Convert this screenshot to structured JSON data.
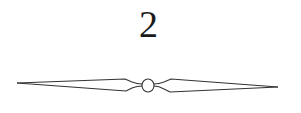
{
  "page": {
    "chapter_number": "2",
    "ornament": {
      "type": "double-tapered-rule-with-center-circle",
      "stroke_color": "#333333"
    }
  }
}
